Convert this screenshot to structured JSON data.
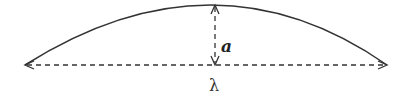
{
  "diagram": {
    "type": "arc-wave-dimension",
    "labels": {
      "amplitude": "a",
      "wavelength": "λ"
    },
    "colors": {
      "stroke": "#333333",
      "background": "#ffffff"
    },
    "elements": [
      {
        "kind": "arc",
        "description": "solid curved arc from left endpoint to right endpoint"
      },
      {
        "kind": "dashed-double-arrow",
        "orientation": "vertical",
        "label": "a"
      },
      {
        "kind": "dashed-double-arrow",
        "orientation": "horizontal",
        "label": "λ"
      }
    ]
  }
}
